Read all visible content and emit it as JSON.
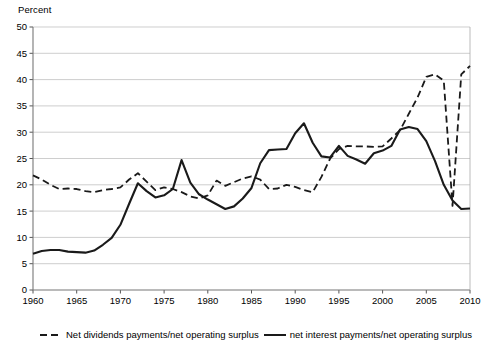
{
  "axis_title": "Percent",
  "legend": {
    "dashed_label": "Net dividends payments/net operating surplus",
    "solid_label": "net interest payments/net operating surplus",
    "dashed_icon": "dashed-line-swatch",
    "solid_icon": "solid-line-swatch"
  },
  "chart_data": {
    "type": "line",
    "title": "",
    "xlabel": "",
    "ylabel": "Percent",
    "xlim": [
      1960,
      2010
    ],
    "ylim": [
      0,
      50
    ],
    "xticks": [
      1960,
      1965,
      1970,
      1975,
      1980,
      1985,
      1990,
      1995,
      2000,
      2005,
      2010
    ],
    "yticks": [
      0,
      5,
      10,
      15,
      20,
      25,
      30,
      35,
      40,
      45,
      50
    ],
    "grid": true,
    "legend_position": "bottom",
    "x": [
      1960,
      1961,
      1962,
      1963,
      1964,
      1965,
      1966,
      1967,
      1968,
      1969,
      1970,
      1971,
      1972,
      1973,
      1974,
      1975,
      1976,
      1977,
      1978,
      1979,
      1980,
      1981,
      1982,
      1983,
      1984,
      1985,
      1986,
      1987,
      1988,
      1989,
      1990,
      1991,
      1992,
      1993,
      1994,
      1995,
      1996,
      1997,
      1998,
      1999,
      2000,
      2001,
      2002,
      2003,
      2004,
      2005,
      2006,
      2007,
      2008,
      2009,
      2010
    ],
    "series": [
      {
        "name": "Net dividends payments/net operating surplus",
        "style": "dashed",
        "color": "#1a1a1a",
        "values": [
          21.8,
          21.0,
          20.0,
          19.2,
          19.3,
          19.2,
          18.8,
          18.6,
          19.0,
          19.2,
          19.5,
          21.0,
          22.2,
          20.6,
          19.0,
          19.5,
          19.2,
          18.6,
          17.8,
          17.4,
          18.0,
          20.8,
          19.8,
          20.5,
          21.2,
          21.6,
          21.0,
          19.2,
          19.3,
          20.0,
          19.6,
          19.0,
          18.6,
          21.5,
          25.0,
          26.8,
          27.4,
          27.3,
          27.3,
          27.2,
          27.3,
          28.8,
          30.4,
          33.5,
          36.6,
          40.5,
          41.0,
          39.8,
          16.0,
          41.0,
          42.6
        ]
      },
      {
        "name": "net interest payments/net operating surplus",
        "style": "solid",
        "color": "#1a1a1a",
        "values": [
          6.9,
          7.4,
          7.6,
          7.6,
          7.3,
          7.2,
          7.1,
          7.5,
          8.6,
          9.9,
          12.4,
          16.4,
          20.3,
          18.8,
          17.6,
          18.0,
          19.2,
          24.7,
          20.4,
          18.2,
          17.2,
          16.3,
          15.4,
          15.9,
          17.4,
          19.4,
          24.1,
          26.6,
          26.7,
          26.8,
          29.8,
          31.7,
          28.0,
          25.4,
          25.2,
          27.4,
          25.5,
          24.8,
          24.0,
          26.0,
          26.5,
          27.4,
          30.5,
          31.0,
          30.6,
          28.3,
          24.5,
          20.0,
          17.0,
          15.4,
          15.5
        ]
      }
    ],
    "dashed_trailing": {
      "note": "dashed series tail after the 2008 dip",
      "x": [
        2008,
        2009,
        2010
      ],
      "values": [
        16.0,
        41.0,
        42.6
      ]
    }
  }
}
